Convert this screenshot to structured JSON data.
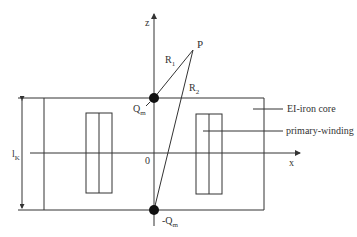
{
  "diagram": {
    "axes": {
      "z_label": "z",
      "x_label": "x",
      "origin_label": "0"
    },
    "point": {
      "label": "P"
    },
    "distances": {
      "r1": {
        "base": "R",
        "sub": "1"
      },
      "r2": {
        "base": "R",
        "sub": "2"
      }
    },
    "charges": {
      "top": {
        "base": "Q",
        "sub": "m"
      },
      "bottom": {
        "base": "-Q",
        "sub": "m"
      }
    },
    "dimension": {
      "base": "l",
      "sub": "K"
    },
    "callouts": {
      "core": "EI-iron core",
      "winding": "primary-winding"
    },
    "colors": {
      "line": "#333333",
      "charge": "#111111"
    }
  }
}
